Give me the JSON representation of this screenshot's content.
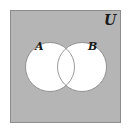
{
  "diagram": {
    "type": "venn",
    "universe": {
      "label": "U",
      "fill": "#b5b5b5",
      "stroke": "#8c8c8c"
    },
    "sets": [
      {
        "label": "A",
        "fill": "#ffffff",
        "stroke": "#808080"
      },
      {
        "label": "B",
        "fill": "#ffffff",
        "stroke": "#808080"
      }
    ],
    "shaded_region": "complement of A ∪ B"
  }
}
